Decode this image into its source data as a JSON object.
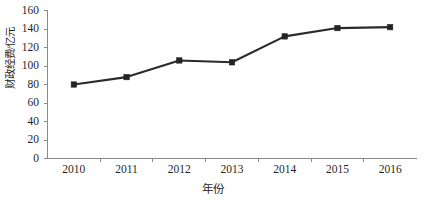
{
  "chart_data": {
    "type": "line",
    "title": "",
    "subtitle": "",
    "xlabel": "年份",
    "ylabel": "财政经费/亿元",
    "categories": [
      "2010",
      "2011",
      "2012",
      "2013",
      "2014",
      "2015",
      "2016"
    ],
    "values": [
      80,
      88,
      106,
      104,
      132,
      141,
      142
    ],
    "series": [
      {
        "name": "财政经费",
        "values": [
          80,
          88,
          106,
          104,
          132,
          141,
          142
        ]
      }
    ],
    "xlim": [
      "2010",
      "2016"
    ],
    "ylim": [
      0,
      160
    ],
    "ytick_labels": [
      "160",
      "140",
      "120",
      "100",
      "80",
      "60",
      "40",
      "20",
      "0"
    ],
    "ytick_values": [
      160,
      140,
      120,
      100,
      80,
      60,
      40,
      20,
      0
    ],
    "ytick_step": 20,
    "xtick_labels": [
      "2010",
      "2011",
      "2012",
      "2013",
      "2014",
      "2015",
      "2016"
    ],
    "grid": false,
    "legend": false,
    "legend_position": "none",
    "marker": "square",
    "line_color": "#2b2b2b",
    "marker_color": "#242424",
    "axis_color": "#8a8a8a",
    "background_color": "#ffffff",
    "annotations": []
  }
}
